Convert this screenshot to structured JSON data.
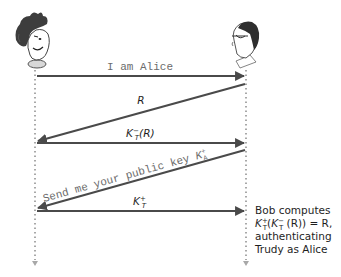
{
  "diagram": {
    "type": "sequence",
    "actors": [
      {
        "id": "trudy",
        "role": "left",
        "depiction": "cartoon-trudy-head"
      },
      {
        "id": "bob",
        "role": "right",
        "depiction": "cartoon-bob-head-with-glasses"
      }
    ],
    "messages": [
      {
        "id": "m1",
        "from": "trudy",
        "to": "bob",
        "label": "I am Alice",
        "style": "monospace"
      },
      {
        "id": "m2",
        "from": "bob",
        "to": "trudy",
        "label": "R",
        "style": "italic"
      },
      {
        "id": "m3",
        "from": "trudy",
        "to": "bob",
        "label_base": "K",
        "label_sub": "T",
        "label_sup": "−",
        "label_tail": "(R)",
        "style": "italic"
      },
      {
        "id": "m4",
        "from": "bob",
        "to": "trudy",
        "label": "Send me your public key ",
        "label_key_base": "K",
        "label_key_sub": "A",
        "label_key_sup": "+",
        "style": "monospace"
      },
      {
        "id": "m5",
        "from": "trudy",
        "to": "bob",
        "label_base": "K",
        "label_sub": "T",
        "label_sup": "+",
        "style": "italic"
      }
    ],
    "note": {
      "line1": "Bob computes",
      "line2_parts": {
        "k1": "K",
        "k1_sub": "T",
        "k1_sup": "+",
        "open": "(",
        "k2": "K",
        "k2_sub": "T",
        "k2_sup": "−",
        "mid": " (R)) = R,"
      },
      "line3": "authenticating",
      "line4": "Trudy as Alice"
    },
    "colors": {
      "arrow": "#4a4a4a",
      "timeline": "#a8a8a8",
      "mono_text": "#6b6b6b",
      "text": "#1e1e1e"
    }
  }
}
